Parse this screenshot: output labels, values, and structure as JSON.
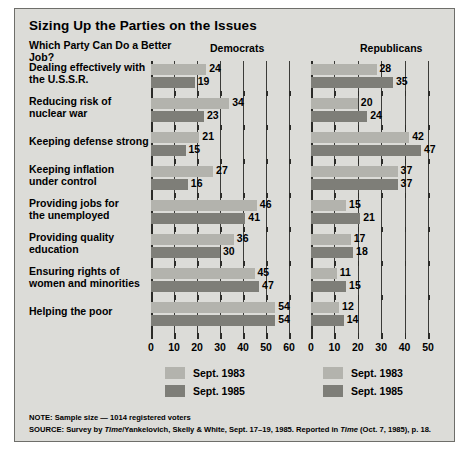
{
  "title": "Sizing Up the Parties on the Issues",
  "subtitle": "Which Party Can Do a Better Job?",
  "panels": {
    "democrats": "Democrats",
    "republicans": "Republicans"
  },
  "legend": {
    "series1": "Sept. 1983",
    "series2": "Sept. 1985"
  },
  "notes": {
    "note_label": "NOTE:",
    "note_text": " Sample size — 1014 registered voters",
    "source_label": "SOURCE:",
    "source_text_a": " Survey by ",
    "source_italic_a": "Time",
    "source_text_b": "/Yankelovich, Skelly & White, Sept. 17–19, 1985. Reported in ",
    "source_italic_b": "Time",
    "source_text_c": " (Oct. 7, 1985), p. 18."
  },
  "colors": {
    "card_background": "#dcdcd8",
    "series1_fill": "#b3b3ad",
    "series2_fill": "#7e7e78",
    "grid": "#3b3b38",
    "text": "#000000"
  },
  "chart_data": {
    "type": "bar",
    "orientation": "horizontal",
    "title": "Sizing Up the Parties on the Issues",
    "subtitle": "Which Party Can Do a Better Job?",
    "xlabel": "",
    "ylabel": "",
    "grid": true,
    "legend_position": "bottom",
    "categories": [
      "Dealing effectively with the U.S.S.R.",
      "Reducing risk of nuclear war",
      "Keeping defense strong",
      "Keeping inflation under control",
      "Providing jobs for the unemployed",
      "Providing quality education",
      "Ensuring rights of women and minorities",
      "Helping the poor"
    ],
    "panels": [
      {
        "name": "Democrats",
        "xlim": [
          0,
          60
        ],
        "xticks": [
          0,
          10,
          20,
          30,
          40,
          50,
          60
        ],
        "series": [
          {
            "name": "Sept. 1983",
            "values": [
              24,
              34,
              21,
              27,
              46,
              36,
              45,
              54
            ]
          },
          {
            "name": "Sept. 1985",
            "values": [
              19,
              23,
              15,
              16,
              41,
              30,
              47,
              54
            ]
          }
        ]
      },
      {
        "name": "Republicans",
        "xlim": [
          0,
          50
        ],
        "xticks": [
          0,
          10,
          20,
          30,
          40,
          50
        ],
        "series": [
          {
            "name": "Sept. 1983",
            "values": [
              28,
              20,
              42,
              37,
              15,
              17,
              11,
              12
            ]
          },
          {
            "name": "Sept. 1985",
            "values": [
              35,
              24,
              47,
              37,
              21,
              18,
              15,
              14
            ]
          }
        ]
      }
    ]
  }
}
